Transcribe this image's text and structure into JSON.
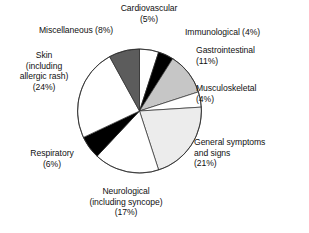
{
  "chart_data": {
    "type": "pie",
    "title": "",
    "subtitle": "",
    "xlabel": "",
    "ylabel": "",
    "legend_position": "none",
    "grid": false,
    "labels_outside": true,
    "start_angle_deg": 0,
    "direction": "clockwise",
    "units": "percent",
    "categories": [
      "Cardiovascular",
      "Immunological",
      "Gastrointestinal",
      "Musculoskeletal",
      "General symptoms and signs",
      "Neurological (including syncope)",
      "Respiratory",
      "Skin (including allergic rash)",
      "Miscellaneous"
    ],
    "values": [
      5,
      4,
      11,
      4,
      21,
      17,
      6,
      24,
      8
    ],
    "colors": [
      "#ffffff",
      "#000000",
      "#c6c6c6",
      "#ffffff",
      "#ececec",
      "#ffffff",
      "#000000",
      "#ffffff",
      "#5c5c5c"
    ],
    "slices": [
      {
        "name": "Cardiovascular",
        "value": 5,
        "label_lines": [
          "Cardiovascular",
          "(5%)"
        ],
        "color": "#ffffff"
      },
      {
        "name": "Immunological",
        "value": 4,
        "label_lines": [
          "Immunological (4%)"
        ],
        "color": "#000000"
      },
      {
        "name": "Gastrointestinal",
        "value": 11,
        "label_lines": [
          "Gastrointestinal",
          "(11%)"
        ],
        "color": "#c6c6c6"
      },
      {
        "name": "Musculoskeletal",
        "value": 4,
        "label_lines": [
          "Musculoskeletal",
          "(4%)"
        ],
        "color": "#ffffff"
      },
      {
        "name": "General symptoms and signs",
        "value": 21,
        "label_lines": [
          "General symptoms",
          "and signs",
          "(21%)"
        ],
        "color": "#ececec"
      },
      {
        "name": "Neurological (including syncope)",
        "value": 17,
        "label_lines": [
          "Neurological",
          "(including syncope)",
          "(17%)"
        ],
        "color": "#ffffff"
      },
      {
        "name": "Respiratory",
        "value": 6,
        "label_lines": [
          "Respiratory",
          "(6%)"
        ],
        "color": "#000000"
      },
      {
        "name": "Skin (including allergic rash)",
        "value": 24,
        "label_lines": [
          "Skin",
          "(including",
          "allergic rash)",
          "(24%)"
        ],
        "color": "#ffffff"
      },
      {
        "name": "Miscellaneous",
        "value": 8,
        "label_lines": [
          "Miscellaneous (8%)"
        ],
        "color": "#5c5c5c"
      }
    ]
  },
  "labels": {
    "cardiovascular": {
      "l1": "Cardiovascular",
      "l2": "(5%)"
    },
    "immunological": {
      "l1": "Immunological (4%)"
    },
    "gastrointestinal": {
      "l1": "Gastrointestinal",
      "l2": "(11%)"
    },
    "musculoskeletal": {
      "l1": "Musculoskeletal",
      "l2": "(4%)"
    },
    "general": {
      "l1": "General symptoms",
      "l2": "and signs",
      "l3": "(21%)"
    },
    "neurological": {
      "l1": "Neurological",
      "l2": "(including syncope)",
      "l3": "(17%)"
    },
    "respiratory": {
      "l1": "Respiratory",
      "l2": "(6%)"
    },
    "skin": {
      "l1": "Skin",
      "l2": "(including",
      "l3": "allergic rash)",
      "l4": "(24%)"
    },
    "miscellaneous": {
      "l1": "Miscellaneous (8%)"
    }
  }
}
